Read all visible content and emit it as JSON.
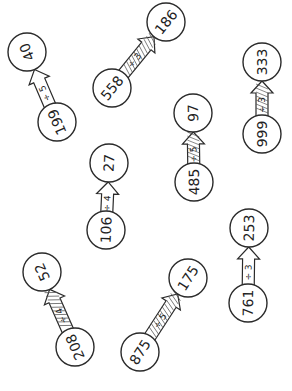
{
  "worksheet": {
    "problems": [
      {
        "start": "199",
        "operation": "÷ 5",
        "result": "40",
        "start_pos": [
          57,
          122
        ],
        "result_pos": [
          27,
          52
        ],
        "hatched": false
      },
      {
        "start": "558",
        "operation": "÷ 3",
        "result": "186",
        "start_pos": [
          112,
          88
        ],
        "result_pos": [
          166,
          22
        ],
        "hatched": true
      },
      {
        "start": "999",
        "operation": "÷ 3",
        "result": "333",
        "start_pos": [
          262,
          134
        ],
        "result_pos": [
          262,
          62
        ],
        "hatched": true
      },
      {
        "start": "485",
        "operation": "÷ 5",
        "result": "97",
        "start_pos": [
          194,
          182
        ],
        "result_pos": [
          193,
          113
        ],
        "hatched": true
      },
      {
        "start": "106",
        "operation": "÷ 4",
        "result": "27",
        "start_pos": [
          106,
          230
        ],
        "result_pos": [
          109,
          163
        ],
        "hatched": false
      },
      {
        "start": "208",
        "operation": "÷ 4",
        "result": "52",
        "start_pos": [
          75,
          347
        ],
        "result_pos": [
          42,
          272
        ],
        "hatched": true
      },
      {
        "start": "875",
        "operation": "÷ 5",
        "result": "175",
        "start_pos": [
          140,
          352
        ],
        "result_pos": [
          188,
          278
        ],
        "hatched": true
      },
      {
        "start": "761",
        "operation": "÷ 3",
        "result": "253",
        "start_pos": [
          248,
          303
        ],
        "result_pos": [
          249,
          228
        ],
        "hatched": false
      }
    ]
  }
}
